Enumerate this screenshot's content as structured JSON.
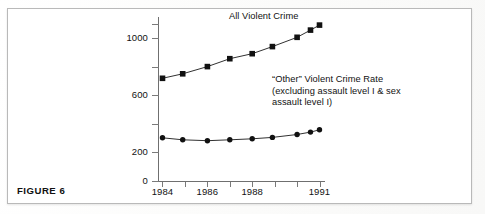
{
  "figure": {
    "label": "FIGURE 6"
  },
  "annotations": {
    "top_series_label": "All Violent Crime",
    "other_series_label_line1": "“Other” Violent Crime Rate",
    "other_series_label_line2": "(excluding assault level I & sex",
    "other_series_label_line3": "assault level I)"
  },
  "axes": {
    "y_ticks_labeled": [
      "1000",
      "600",
      "200",
      "0"
    ],
    "x_ticks_labeled": [
      "1984",
      "1986",
      "1988",
      "1991"
    ]
  },
  "colors": {
    "ink": "#111111",
    "axis": "#6f6f6f",
    "frame": "#b9b9b9",
    "page": "#ffffff"
  },
  "chart_data": {
    "type": "line",
    "title": "",
    "xlabel": "",
    "ylabel": "",
    "x": [
      1984,
      1984.9,
      1986,
      1987,
      1988,
      1988.9,
      1990,
      1990.6,
      1991
    ],
    "x_tick_values": [
      1984,
      1985,
      1986,
      1987,
      1988,
      1989,
      1990,
      1991
    ],
    "x_tick_labels": [
      "1984",
      "",
      "1986",
      "",
      "1988",
      "",
      "",
      "1991"
    ],
    "y_tick_values": [
      0,
      200,
      400,
      600,
      800,
      1000,
      1100
    ],
    "y_tick_labels": [
      "0",
      "200",
      "",
      "600",
      "",
      "1000",
      ""
    ],
    "xlim": [
      1983.8,
      1991.2
    ],
    "ylim": [
      0,
      1150
    ],
    "grid": false,
    "legend": "none",
    "series": [
      {
        "name": "All Violent Crime",
        "marker": "square",
        "values": [
          718,
          750,
          800,
          855,
          890,
          940,
          1005,
          1055,
          1090
        ]
      },
      {
        "name": "“Other” Violent Crime Rate (excluding assault level I & sex assault level I)",
        "marker": "circle",
        "values": [
          302,
          288,
          282,
          288,
          295,
          305,
          325,
          342,
          358
        ]
      }
    ]
  }
}
